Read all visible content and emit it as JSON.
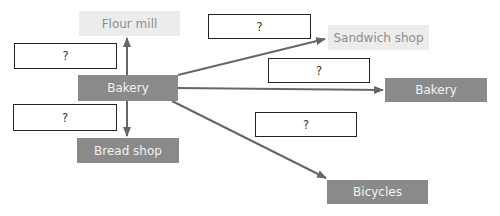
{
  "diagram": {
    "colors": {
      "dark_node": "#8a8a8a",
      "light_node": "#ececec",
      "arrow": "#666666",
      "blank_border": "#222222"
    },
    "nodes": {
      "flour_mill": {
        "label": "Flour mill"
      },
      "bakery_center": {
        "label": "Bakery"
      },
      "bread_shop": {
        "label": "Bread shop"
      },
      "sandwich_shop": {
        "label": "Sandwich shop"
      },
      "bakery_right": {
        "label": "Bakery"
      },
      "bicycles": {
        "label": "Bicycles"
      }
    },
    "blanks": [
      {
        "id": "left-top",
        "label": "?"
      },
      {
        "id": "left-bottom",
        "label": "?"
      },
      {
        "id": "top",
        "label": "?"
      },
      {
        "id": "middle",
        "label": "?"
      },
      {
        "id": "bottom-right",
        "label": "?"
      }
    ],
    "edges": [
      {
        "from": "Bakery",
        "to": "Flour mill"
      },
      {
        "from": "Bakery",
        "to": "Bread shop"
      },
      {
        "from": "Bakery",
        "to": "Sandwich shop"
      },
      {
        "from": "Bakery",
        "to": "Bakery"
      },
      {
        "from": "Bakery",
        "to": "Bicycles"
      }
    ]
  }
}
